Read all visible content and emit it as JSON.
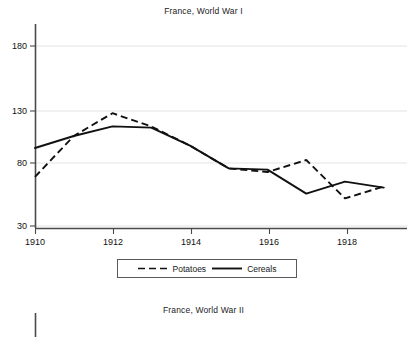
{
  "figure": {
    "panel1_title": "France, World War I",
    "panel2_title": "France, World War II"
  },
  "legend": {
    "items": [
      {
        "label": "Potatoes",
        "style": "dashed",
        "color": "#111111"
      },
      {
        "label": "Cereals",
        "style": "solid",
        "color": "#111111"
      }
    ]
  },
  "chart_data": {
    "type": "line",
    "title": "France, World War I",
    "xlabel": "",
    "ylabel": "",
    "x": [
      1910,
      1911,
      1912,
      1913,
      1914,
      1915,
      1916,
      1917,
      1918,
      1919
    ],
    "xtick_labels": [
      "1910",
      "1912",
      "1914",
      "1916",
      "1918"
    ],
    "xticks": [
      1910,
      1912,
      1914,
      1916,
      1918
    ],
    "xlim": [
      1910,
      1919.6
    ],
    "ytick_labels": [
      "30",
      "80",
      "130",
      "180"
    ],
    "yticks": [
      30,
      80,
      130,
      180
    ],
    "ylim": [
      23,
      196
    ],
    "grid": "horizontal",
    "legend_position": "below-axes",
    "series": [
      {
        "name": "Potatoes",
        "style": "dashed",
        "color": "#111111",
        "values": [
          71,
          105,
          124,
          113,
          97,
          78,
          75,
          85,
          53,
          63
        ]
      },
      {
        "name": "Cereals",
        "style": "solid",
        "color": "#111111",
        "values": [
          95,
          105,
          113,
          112,
          97,
          78,
          77,
          57,
          67,
          62
        ]
      }
    ]
  }
}
